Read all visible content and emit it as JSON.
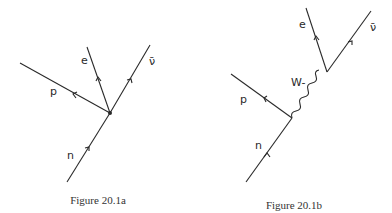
{
  "figures": [
    {
      "id": "20.1a",
      "caption": "Figure 20.1a",
      "description": "Four-fermion point interaction (beta decay)",
      "labels": {
        "electron": "e",
        "antineutrino": "ν̄",
        "proton": "p",
        "neutron": "n"
      }
    },
    {
      "id": "20.1b",
      "caption": "Figure 20.1b",
      "description": "Beta decay mediated by W- boson",
      "labels": {
        "electron": "e",
        "antineutrino": "ν̄",
        "boson": "W-",
        "proton": "p",
        "neutron": "n"
      }
    }
  ],
  "colors": {
    "ink": "#2a2a2a",
    "background": "#ffffff"
  }
}
